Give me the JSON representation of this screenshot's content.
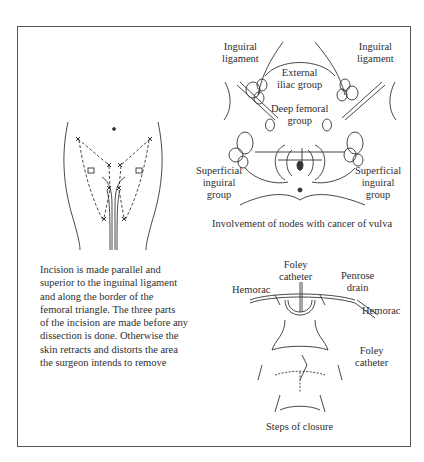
{
  "figure": {
    "incision_panel": {
      "description_lines": [
        "Incision is made parallel and",
        "superior to the inguinal ligament",
        "and along the border of the",
        "femoral triangle. The three parts",
        "of the incision are made before any",
        "dissection is done. Otherwise the",
        "skin retracts and distorts the area",
        "the surgeon intends to remove"
      ]
    },
    "nodes_panel": {
      "labels": {
        "inguinal_ligament_left": [
          "Inguiral",
          "ligament"
        ],
        "inguinal_ligament_right": [
          "Inguiral",
          "ligament"
        ],
        "external_iliac": [
          "External",
          "iliac group"
        ],
        "deep_femoral": [
          "Deep femoral",
          "group"
        ],
        "superficial_left": [
          "Superficial",
          "inguiral",
          "group"
        ],
        "superficial_right": [
          "Superficial",
          "inguiral",
          "group"
        ]
      },
      "caption": "Involvement of nodes with cancer of vulva"
    },
    "closure_panel": {
      "labels": {
        "hemorac_left": "Hemorac",
        "foley_top": [
          "Foley",
          "catheter"
        ],
        "penrose": [
          "Penrose",
          "drain"
        ],
        "hemorac_right": "Hemorac",
        "foley_bottom": [
          "Foley",
          "catheter"
        ]
      },
      "caption": "Steps of closure"
    }
  }
}
